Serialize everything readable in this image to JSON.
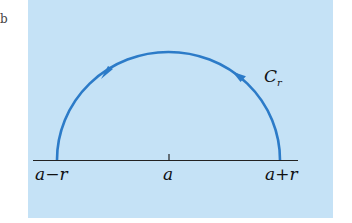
{
  "figure": {
    "panel_label": "b",
    "background_color": "#c5e2f6",
    "curve_color": "#2c7bc8",
    "axis_color": "#222222"
  },
  "contour": {
    "name": "C",
    "subscript": "r",
    "shape": "upper semicircle",
    "orientation": "counterclockwise"
  },
  "axis_labels": {
    "left": "a−r",
    "center": "a",
    "right": "a+r"
  }
}
